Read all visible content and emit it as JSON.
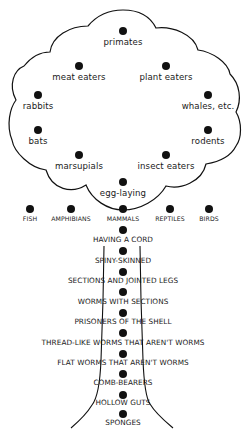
{
  "diagram": {
    "type": "tree-of-life",
    "colors": {
      "ink": "#111111",
      "background": "#ffffff"
    },
    "canopy": {
      "title": "mammals subgroups",
      "nodes": [
        {
          "label": "primates",
          "x": 123,
          "y": 31
        },
        {
          "label": "meat eaters",
          "x": 79,
          "y": 66
        },
        {
          "label": "plant eaters",
          "x": 166,
          "y": 66
        },
        {
          "label": "rabbits",
          "x": 38,
          "y": 95
        },
        {
          "label": "whales, etc.",
          "x": 208,
          "y": 95
        },
        {
          "label": "bats",
          "x": 38,
          "y": 130
        },
        {
          "label": "rodents",
          "x": 208,
          "y": 130
        },
        {
          "label": "marsupials",
          "x": 79,
          "y": 155
        },
        {
          "label": "insect eaters",
          "x": 166,
          "y": 155
        },
        {
          "label": "egg-laying",
          "x": 123,
          "y": 182
        }
      ]
    },
    "branch_row": {
      "nodes": [
        {
          "label": "FISH",
          "x": 30,
          "y": 209
        },
        {
          "label": "AMPHIBIANS",
          "x": 71,
          "y": 209
        },
        {
          "label": "MAMMALS",
          "x": 123,
          "y": 209
        },
        {
          "label": "REPTILES",
          "x": 170,
          "y": 209
        },
        {
          "label": "BIRDS",
          "x": 209,
          "y": 209
        }
      ]
    },
    "trunk": {
      "nodes": [
        {
          "label": "HAVING A CORD",
          "y": 230
        },
        {
          "label": "SPINY-SKINNED",
          "y": 251
        },
        {
          "label": "SECTIONS AND JOINTED LEGS",
          "y": 272
        },
        {
          "label": "WORMS WITH SECTIONS",
          "y": 292
        },
        {
          "label": "PRISONERS OF THE SHELL",
          "y": 313
        },
        {
          "label": "THREAD-LIKE WORMS THAT AREN'T WORMS",
          "y": 333
        },
        {
          "label": "FLAT WORMS THAT AREN'T WORMS",
          "y": 354
        },
        {
          "label": "COMB-BEARERS",
          "y": 374
        },
        {
          "label": "HOLLOW GUTS",
          "y": 395
        },
        {
          "label": "SPONGES",
          "y": 414
        }
      ]
    }
  }
}
